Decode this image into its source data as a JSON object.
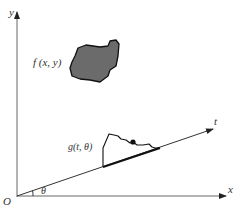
{
  "diagram": {
    "title": "",
    "axes": {
      "x_label": "x",
      "y_label": "y",
      "t_label": "t",
      "origin_label": "O",
      "angle_label": "θ"
    },
    "object": {
      "label": "f (x, y)",
      "fill": "#6b6b6b",
      "stroke": "#111111"
    },
    "projection": {
      "label": "g(t, θ)"
    },
    "colors": {
      "axis": "#555555",
      "line": "#222222",
      "background": "#ffffff"
    }
  }
}
